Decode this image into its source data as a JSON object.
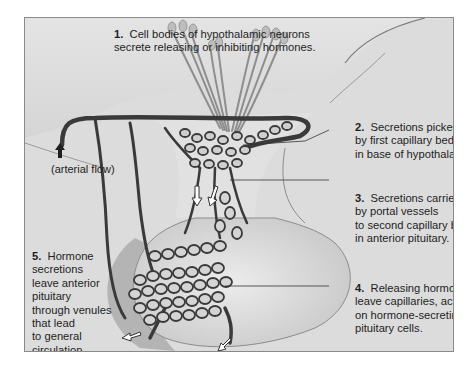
{
  "figure": {
    "colors": {
      "background": "#dcdcdc",
      "frame_border": "#8a8a8a",
      "vessel": "#3a3a3a",
      "tissue_light": "#e6e6e6",
      "tissue_shade": "#b8b8b8",
      "text": "#1e1e1e"
    },
    "labels": [
      {
        "number": "1.",
        "lines": [
          "Cell bodies of hypothalamic neurons",
          "secrete releasing or inhibiting hormones."
        ]
      },
      {
        "number": "2.",
        "lines": [
          "Secretions picked up",
          "by first capillary bed",
          "in base of hypothalamus."
        ]
      },
      {
        "number": "3.",
        "lines": [
          "Secretions carried",
          "by portal vessels",
          "to second capillary bed,",
          "in anterior pituitary."
        ]
      },
      {
        "number": "4.",
        "lines": [
          "Releasing hormones",
          "leave capillaries, act",
          "on hormone-secreting",
          "pituitary cells."
        ]
      },
      {
        "number": "5.",
        "lines": [
          "Hormone",
          "secretions",
          "leave anterior",
          "pituitary",
          "through venules",
          "that lead",
          "to general",
          "circulation."
        ]
      }
    ],
    "annotations": {
      "arterial_flow": "(arterial flow)"
    },
    "icons": {
      "arterial_arrow": "up-arrow-icon",
      "flow_arrows": "hollow-arrow-icon"
    }
  }
}
